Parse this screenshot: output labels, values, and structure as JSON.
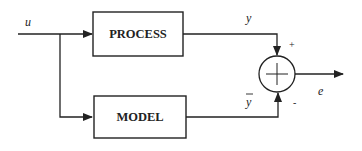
{
  "diagram": {
    "type": "block-diagram",
    "blocks": [
      {
        "id": "process",
        "label": "PROCESS"
      },
      {
        "id": "model",
        "label": "MODEL"
      }
    ],
    "signals": {
      "input": "u",
      "process_output": "y",
      "model_output": "y",
      "error_output": "e"
    },
    "summing_junction": {
      "plus_sign": "+",
      "minus_sign": "-"
    },
    "colors": {
      "stroke": "#222222",
      "background": "#ffffff"
    }
  }
}
